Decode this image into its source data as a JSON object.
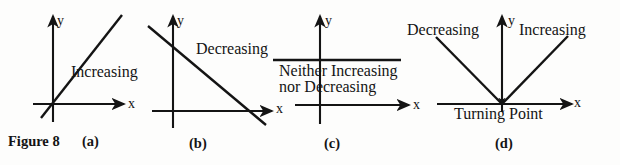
{
  "figure": {
    "caption_prefix": "Figure 8",
    "caption_label_a": "(a)",
    "caption_label_b": "(b)",
    "caption_label_c": "(c)",
    "caption_label_d": "(d)",
    "ink_color": "#141414",
    "background_color": "#fdfdfc"
  },
  "panels": [
    {
      "id": "a",
      "caption": "(a)",
      "axis_x_label": "x",
      "axis_y_label": "y",
      "annotation": "Increasing",
      "curve_type": "line",
      "slope_sign": "positive"
    },
    {
      "id": "b",
      "caption": "(b)",
      "axis_x_label": "x",
      "axis_y_label": "y",
      "annotation": "Decreasing",
      "curve_type": "line",
      "slope_sign": "negative"
    },
    {
      "id": "c",
      "caption": "(c)",
      "axis_x_label": "x",
      "axis_y_label": "y",
      "annotation_line1": "Neither Increasing",
      "annotation_line2": "nor Decreasing",
      "curve_type": "line",
      "slope_sign": "zero"
    },
    {
      "id": "d",
      "caption": "(d)",
      "axis_x_label": "x",
      "axis_y_label": "y",
      "annotation_left": "Decreasing",
      "annotation_right": "Increasing",
      "annotation_vertex": "Turning Point",
      "curve_type": "v-shape",
      "slope_sign": "negative-then-positive"
    }
  ]
}
